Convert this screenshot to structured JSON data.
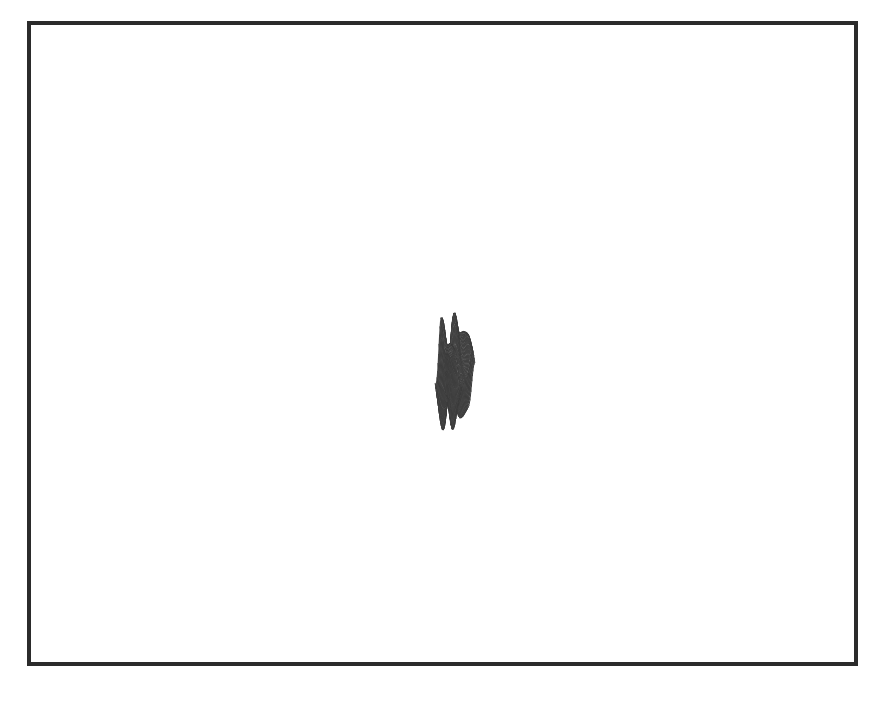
{
  "figure": {
    "kind": "3d-wireframe-surface-plot",
    "title": "",
    "caption": "",
    "background_color": "#ffffff",
    "frame": {
      "visible": true,
      "color": "#2b2b2b",
      "thickness_px": 4,
      "x": 27,
      "y": 21,
      "width": 831,
      "height": 645
    },
    "rendering": {
      "hidden_line_removal": true,
      "shading": "lambertian-grayscale",
      "mesh_line_color": "#3a3a3a",
      "mesh_line_width": 0.85,
      "face_fill_min": "#6f6f6f",
      "face_fill_max": "#ffffff",
      "back_face_fill": "#ffffff",
      "light_direction": [
        -0.55,
        -0.35,
        0.76
      ]
    },
    "projection": {
      "type": "oblique-parallel",
      "azimuth_deg": -37,
      "elevation_deg": 22,
      "x_axis_screen": [
        4.05,
        1.62
      ],
      "y_axis_screen": [
        -2.55,
        1.72
      ],
      "z_scale_px": 58,
      "origin_x": 455,
      "origin_y": 372
    }
  },
  "chart_data": {
    "type": "surface",
    "xlabel": "",
    "ylabel": "",
    "zlabel": "",
    "grid": false,
    "legend": "none",
    "axes_visible": false,
    "tick_labels_x": [],
    "tick_labels_y": [],
    "tick_labels_z": [],
    "nx": 46,
    "ny": 32,
    "xlim": [
      -3.0,
      3.0
    ],
    "ylim": [
      -3.0,
      3.0
    ],
    "zlim": [
      -1.25,
      1.35
    ],
    "function_terms": [
      {
        "amplitude": 0.95,
        "kx": 1.55,
        "ky": 0.65,
        "phase": 0.35,
        "type": "sin"
      },
      {
        "amplitude": 0.6,
        "kx": 0.75,
        "ky": 1.45,
        "phase": 1.15,
        "type": "cos"
      },
      {
        "amplitude": 0.42,
        "kx": 2.35,
        "ky": 0.3,
        "phase": 2.4,
        "type": "sin"
      },
      {
        "amplitude": 0.3,
        "kx": 0.45,
        "ky": 2.1,
        "phase": 0.8,
        "type": "sin"
      },
      {
        "amplitude": 0.22,
        "kx": 3.1,
        "ky": 1.1,
        "phase": 1.9,
        "type": "cos"
      }
    ],
    "envelope": {
      "type": "gaussian",
      "sigma_x": 2.35,
      "sigma_y": 2.05
    }
  }
}
